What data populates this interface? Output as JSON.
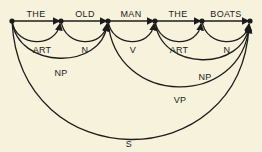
{
  "diagram": {
    "type": "transition-network-parse",
    "colors": {
      "background": "#f6f2dc",
      "ink": "#1c1c1c"
    },
    "nodes": [
      {
        "id": "n0",
        "x": 12,
        "y": 21
      },
      {
        "id": "n1",
        "x": 61,
        "y": 21
      },
      {
        "id": "n2",
        "x": 108,
        "y": 21
      },
      {
        "id": "n3",
        "x": 155,
        "y": 21
      },
      {
        "id": "n4",
        "x": 202,
        "y": 21
      },
      {
        "id": "n5",
        "x": 250,
        "y": 21
      }
    ],
    "words": [
      {
        "label": "THE",
        "from": "n0",
        "to": "n1"
      },
      {
        "label": "OLD",
        "from": "n1",
        "to": "n2"
      },
      {
        "label": "MAN",
        "from": "n2",
        "to": "n3"
      },
      {
        "label": "THE",
        "from": "n3",
        "to": "n4"
      },
      {
        "label": "BOATS",
        "from": "n4",
        "to": "n5"
      }
    ],
    "arcs": [
      {
        "label": "ART",
        "from": "n0",
        "to": "n1"
      },
      {
        "label": "N",
        "from": "n1",
        "to": "n2"
      },
      {
        "label": "NP",
        "from": "n0",
        "to": "n2"
      },
      {
        "label": "V",
        "from": "n2",
        "to": "n3"
      },
      {
        "label": "ART",
        "from": "n3",
        "to": "n4"
      },
      {
        "label": "N",
        "from": "n4",
        "to": "n5"
      },
      {
        "label": "NP",
        "from": "n3",
        "to": "n5"
      },
      {
        "label": "VP",
        "from": "n2",
        "to": "n5"
      },
      {
        "label": "S",
        "from": "n0",
        "to": "n5"
      }
    ]
  }
}
